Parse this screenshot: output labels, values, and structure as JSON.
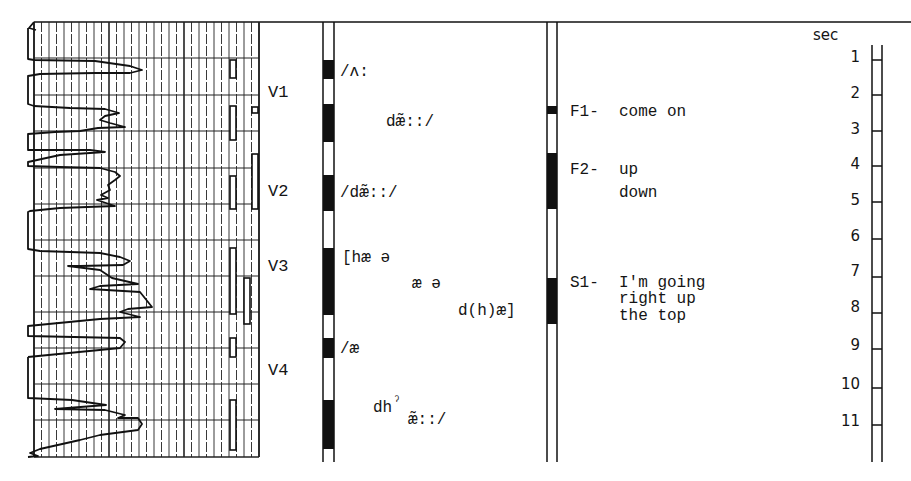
{
  "chart_data": {
    "type": "line",
    "title": "",
    "time_axis": {
      "label": "sec",
      "ticks": [
        "1",
        "2",
        "3",
        "4",
        "5",
        "6",
        "7",
        "8",
        "9",
        "10",
        "11"
      ],
      "range": [
        0,
        11.5
      ]
    },
    "grid": true,
    "child_vocalizations": [
      {
        "label": "V1",
        "approx_sec": [
          1.2,
          3.4
        ]
      },
      {
        "label": "V2",
        "approx_sec": [
          4.2,
          5.1
        ]
      },
      {
        "label": "V3",
        "approx_sec": [
          6.4,
          8.2
        ]
      },
      {
        "label": "V4",
        "approx_sec": [
          8.8,
          11.5
        ]
      }
    ],
    "child_transcriptions": [
      {
        "text": "/ʌ:",
        "sec": 1.4
      },
      {
        "text": "dæ̃::/",
        "sec": 2.6
      },
      {
        "text": "/dæ̃::/",
        "sec": 4.6
      },
      {
        "text": "[hæ ə",
        "sec": 6.4
      },
      {
        "text": "æ ə",
        "sec": 7.0
      },
      {
        "text": "d(h)æ]",
        "sec": 7.6
      },
      {
        "text": "/æ",
        "sec": 9.0
      },
      {
        "text": "dhˀ",
        "sec": 10.4
      },
      {
        "text": "æ̃::/",
        "sec": 10.7
      }
    ],
    "adult_utterances": [
      {
        "speaker": "F1-",
        "lines": [
          "come on"
        ],
        "sec": 2.5
      },
      {
        "speaker": "F2-",
        "lines": [
          "up",
          "down"
        ],
        "sec": 4.1
      },
      {
        "speaker": "S1-",
        "lines": [
          "I'm going",
          "right up",
          "the top"
        ],
        "sec": 7.0
      }
    ]
  },
  "labels": {
    "v1": "V1",
    "v2": "V2",
    "v3": "V3",
    "v4": "V4",
    "t1": "/ʌ:",
    "t2": "dæ̃::/",
    "t3": "/dæ̃::/",
    "t4": "[hæ ə",
    "t5": "æ ə",
    "t6": "d(h)æ]",
    "t7": "/æ",
    "t8a": "dh",
    "t8b": "ˀ",
    "t8c": "æ̃::/",
    "f1_speaker": "F1-",
    "f1_line1": "come on",
    "f2_speaker": "F2-",
    "f2_line1": "up",
    "f2_line2": "down",
    "s1_speaker": "S1-",
    "s1_line1": "I'm going",
    "s1_line2": "right up",
    "s1_line3": "the top",
    "sec": "sec",
    "n1": "1",
    "n2": "2",
    "n3": "3",
    "n4": "4",
    "n5": "5",
    "n6": "6",
    "n7": "7",
    "n8": "8",
    "n9": "9",
    "n10": "10",
    "n11": "11"
  }
}
